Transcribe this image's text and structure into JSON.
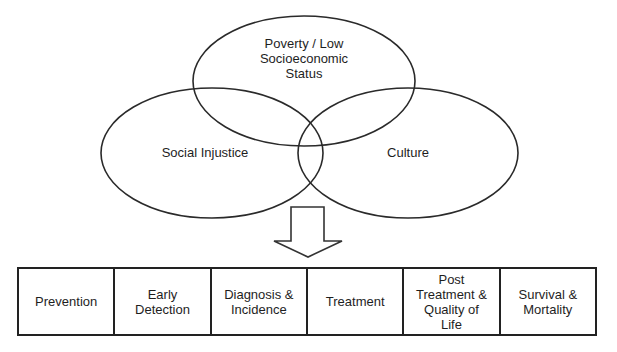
{
  "venn": {
    "circles": [
      {
        "id": "poverty",
        "label": "Poverty / Low\nSocioeconomic\nStatus",
        "cx": 304,
        "cy": 81,
        "rx": 111,
        "ry": 65
      },
      {
        "id": "social-injustice",
        "label": "Social Injustice",
        "cx": 212,
        "cy": 153,
        "rx": 111,
        "ry": 65
      },
      {
        "id": "culture",
        "label": "Culture",
        "cx": 408,
        "cy": 153,
        "rx": 110,
        "ry": 65
      }
    ],
    "stroke_color": "#2a2a2a"
  },
  "arrow": {
    "direction": "down",
    "icon": "down-arrow-icon"
  },
  "continuum": {
    "stages": [
      "Prevention",
      "Early\nDetection",
      "Diagnosis &\nIncidence",
      "Treatment",
      "Post\nTreatment &\nQuality of\nLife",
      "Survival &\nMortality"
    ]
  }
}
